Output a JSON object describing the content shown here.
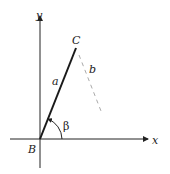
{
  "diagram": {
    "axes": {
      "x_label": "x",
      "y_label": "y"
    },
    "points": {
      "origin": "B",
      "end": "C"
    },
    "segments": {
      "solid": "a",
      "dashed": "b"
    },
    "angle": {
      "label": "β"
    },
    "colors": {
      "solid_line": "#1a1a1a",
      "dashed_line": "#aaaaaa",
      "axis": "#222222"
    }
  }
}
